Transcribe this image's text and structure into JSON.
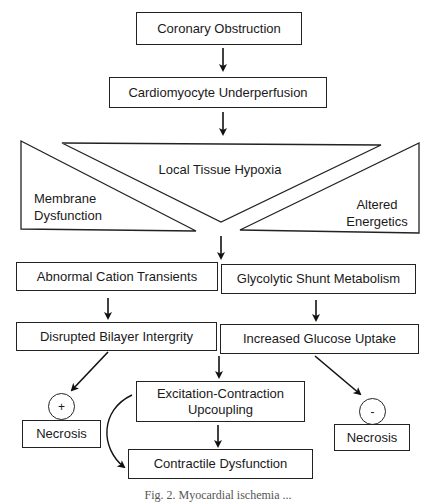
{
  "diagram": {
    "type": "flowchart",
    "nodes": {
      "coronary_obstruction": "Coronary Obstruction",
      "cardiomyocyte_underperfusion": "Cardiomyocyte Underperfusion",
      "local_tissue_hypoxia": "Local Tissue Hypoxia",
      "membrane_dysfunction_line1": "Membrane",
      "membrane_dysfunction_line2": "Dysfunction",
      "altered_energetics_line1": "Altered",
      "altered_energetics_line2": "Energetics",
      "abnormal_cation_transients": "Abnormal Cation Transients",
      "glycolytic_shunt_metabolism": "Glycolytic Shunt Metabolism",
      "disrupted_bilayer_integrity": "Disrupted Bilayer Intergrity",
      "increased_glucose_uptake": "Increased Glucose Uptake",
      "excitation_contraction_line1": "Excitation-Contraction",
      "excitation_contraction_line2": "Upcoupling",
      "contractile_dysfunction": "Contractile Dysfunction",
      "necrosis_left": "Necrosis",
      "necrosis_right": "Necrosis"
    },
    "modifiers": {
      "left_sign": "+",
      "right_sign": "-"
    },
    "edges": [
      {
        "from": "Coronary Obstruction",
        "to": "Cardiomyocyte Underperfusion"
      },
      {
        "from": "Cardiomyocyte Underperfusion",
        "to": "Local Tissue Hypoxia"
      },
      {
        "from": "Local Tissue Hypoxia",
        "to": "Abnormal Cation Transients / Glycolytic Shunt Metabolism"
      },
      {
        "from": "Abnormal Cation Transients",
        "to": "Disrupted Bilayer Intergrity"
      },
      {
        "from": "Glycolytic Shunt Metabolism",
        "to": "Increased Glucose Uptake"
      },
      {
        "from": "Disrupted Bilayer Intergrity",
        "to": "Necrosis (+)"
      },
      {
        "from": "Increased Glucose Uptake",
        "to": "Necrosis (-)"
      },
      {
        "from": "Disrupted Bilayer Intergrity / Increased Glucose Uptake",
        "to": "Excitation-Contraction Upcoupling"
      },
      {
        "from": "Excitation-Contraction Upcoupling",
        "to": "Contractile Dysfunction"
      }
    ],
    "caption": "Fig. 2. Myocardial ischemia ..."
  }
}
